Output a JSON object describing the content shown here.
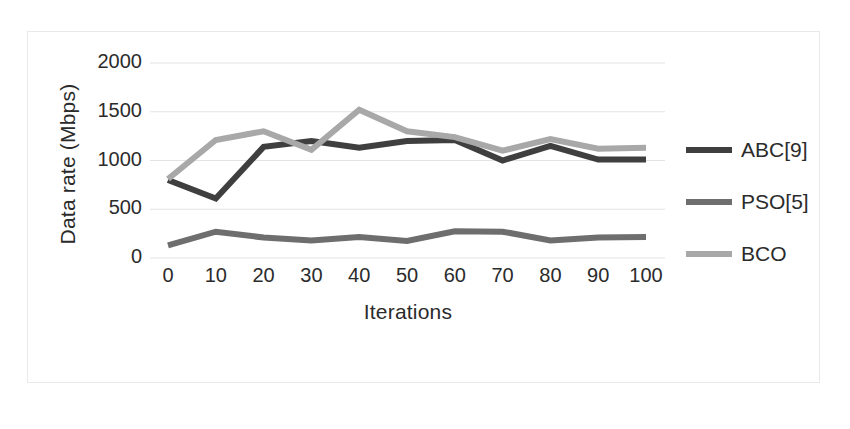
{
  "chart_data": {
    "type": "line",
    "title": "",
    "xlabel": "Iterations",
    "ylabel": "Data rate (Mbps)",
    "x": [
      0,
      10,
      20,
      30,
      40,
      50,
      60,
      70,
      80,
      90,
      100
    ],
    "xtick_labels": [
      "0",
      "10",
      "20",
      "30",
      "40",
      "50",
      "60",
      "70",
      "80",
      "90",
      "100"
    ],
    "ytick_labels": [
      "0",
      "500",
      "1000",
      "1500",
      "2000"
    ],
    "yticks": [
      0,
      500,
      1000,
      1500,
      2000
    ],
    "xlim": [
      0,
      100
    ],
    "ylim": [
      0,
      2000
    ],
    "grid": "horizontal",
    "legend_position": "right",
    "series": [
      {
        "name": "ABC[9]",
        "color": "#3f3f3f",
        "values": [
          800,
          610,
          1140,
          1200,
          1130,
          1200,
          1210,
          1000,
          1150,
          1010,
          1010
        ]
      },
      {
        "name": "PSO[5]",
        "color": "#6e6e6e",
        "values": [
          130,
          270,
          210,
          180,
          215,
          175,
          275,
          270,
          180,
          210,
          215
        ]
      },
      {
        "name": "BCO",
        "color": "#a8a8a8",
        "values": [
          810,
          1210,
          1300,
          1110,
          1520,
          1300,
          1240,
          1100,
          1220,
          1120,
          1130
        ]
      }
    ]
  },
  "axes": {
    "y_title": "Data rate (Mbps)",
    "x_title": "Iterations"
  },
  "legend": {
    "items": [
      {
        "label": "ABC[9]",
        "color": "#3f3f3f"
      },
      {
        "label": "PSO[5]",
        "color": "#6e6e6e"
      },
      {
        "label": "BCO",
        "color": "#a8a8a8"
      }
    ]
  },
  "style": {
    "plot_background": "#ffffff",
    "gridline_color": "#e3e3e5",
    "text_color": "#2b2b2b",
    "frame_color": "#e9e9ea"
  }
}
